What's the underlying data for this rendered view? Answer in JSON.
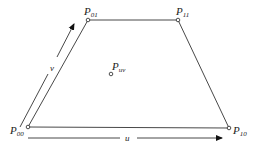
{
  "diagram": {
    "type": "bilinear-patch",
    "colors": {
      "stroke": "#333333",
      "text": "#222222",
      "background": "#ffffff"
    },
    "points": [
      {
        "id": "P00",
        "label": "P",
        "subscript": "00",
        "x": 28,
        "y": 127
      },
      {
        "id": "P01",
        "label": "P",
        "subscript": "01",
        "x": 88,
        "y": 20
      },
      {
        "id": "P11",
        "label": "P",
        "subscript": "11",
        "x": 178,
        "y": 20
      },
      {
        "id": "P10",
        "label": "P",
        "subscript": "10",
        "x": 229,
        "y": 128
      },
      {
        "id": "Puv",
        "label": "P",
        "subscript": "uv",
        "x": 111,
        "y": 74
      }
    ],
    "edges": [
      [
        "P00",
        "P01"
      ],
      [
        "P01",
        "P11"
      ],
      [
        "P11",
        "P10"
      ],
      [
        "P10",
        "P00"
      ]
    ],
    "axes": {
      "u": {
        "label": "u",
        "from": [
          28,
          138
        ],
        "to": [
          222,
          138
        ]
      },
      "v": {
        "label": "v",
        "from": [
          20,
          127
        ],
        "to": [
          74,
          22
        ]
      }
    }
  }
}
